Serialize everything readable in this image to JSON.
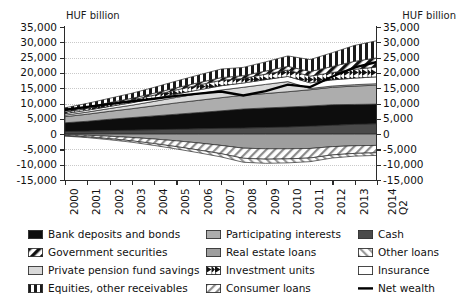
{
  "units": {
    "left": "HUF billion",
    "right": "HUF billion"
  },
  "axes": {
    "y_ticks": [
      "35,000",
      "30,000",
      "25,000",
      "20,000",
      "15,000",
      "10,000",
      "5,000",
      "0",
      "-5,000",
      "-10,000",
      "-15,000"
    ],
    "y_values": [
      35000,
      30000,
      25000,
      20000,
      15000,
      10000,
      5000,
      0,
      -5000,
      -10000,
      -15000
    ],
    "x_ticks": [
      "2000",
      "2001",
      "2002",
      "2003",
      "2004",
      "2005",
      "2006",
      "2007",
      "2008",
      "2009",
      "2010",
      "2011",
      "2012",
      "2013",
      "2014"
    ],
    "x_last_sub": "Q2"
  },
  "legend": {
    "col1": [
      {
        "label": "Bank deposits and bonds",
        "swatch": "solid-dark"
      },
      {
        "label": "Government securities",
        "swatch": "diag-black-white"
      },
      {
        "label": "Private pension fund savings",
        "swatch": "solid-light"
      },
      {
        "label": "Equities, other receivables",
        "swatch": "vertical-black"
      }
    ],
    "col2": [
      {
        "label": "Participating interests",
        "swatch": "solid-mid"
      },
      {
        "label": "Real estate loans",
        "swatch": "solid-midlight"
      },
      {
        "label": "Investment units",
        "swatch": "wedge-black"
      },
      {
        "label": "Consumer loans",
        "swatch": "diag-hatch-dark"
      }
    ],
    "col3": [
      {
        "label": "Cash",
        "swatch": "solid-dark2"
      },
      {
        "label": "Other loans",
        "swatch": "diag-hatch-mid"
      },
      {
        "label": "Insurance",
        "swatch": "solid-white"
      },
      {
        "label": "Net wealth",
        "swatch": "line-black"
      }
    ]
  },
  "chart_data": {
    "type": "area",
    "title": "",
    "subtitle": "",
    "xlabel": "",
    "ylabel": "HUF billion",
    "ylim": [
      -15000,
      35000
    ],
    "grid": true,
    "legend_position": "bottom",
    "stacked": true,
    "x": [
      "2000",
      "2001",
      "2002",
      "2003",
      "2004",
      "2005",
      "2006",
      "2007",
      "2008",
      "2009",
      "2010",
      "2011",
      "2012",
      "2013",
      "2014 Q2"
    ],
    "series": [
      {
        "name": "Cash",
        "sign": "positive",
        "fill": "solid-dark2",
        "values": [
          900,
          1000,
          1150,
          1300,
          1450,
          1600,
          1750,
          1900,
          2000,
          2150,
          2350,
          2600,
          2900,
          3200,
          3400
        ]
      },
      {
        "name": "Bank deposits and bonds",
        "sign": "positive",
        "fill": "solid-dark",
        "values": [
          2800,
          3200,
          3700,
          4100,
          4500,
          4900,
          5300,
          5700,
          6200,
          6400,
          6500,
          6600,
          6700,
          6500,
          6400
        ]
      },
      {
        "name": "Participating interests",
        "sign": "positive",
        "fill": "solid-mid",
        "values": [
          2000,
          2300,
          2600,
          2900,
          3300,
          3700,
          4000,
          4300,
          4500,
          4700,
          5000,
          5300,
          5700,
          6000,
          6200
        ]
      },
      {
        "name": "Private pension fund savings",
        "sign": "positive",
        "fill": "solid-light",
        "values": [
          500,
          700,
          900,
          1150,
          1450,
          1800,
          2150,
          2500,
          2600,
          3000,
          3300,
          400,
          420,
          450,
          470
        ]
      },
      {
        "name": "Insurance",
        "sign": "positive",
        "fill": "solid-white",
        "values": [
          500,
          600,
          700,
          800,
          950,
          1100,
          1250,
          1400,
          1400,
          1550,
          1700,
          1850,
          2000,
          2150,
          2250
        ]
      },
      {
        "name": "Investment units",
        "sign": "positive",
        "fill": "wedge-black",
        "values": [
          500,
          600,
          750,
          900,
          1100,
          1350,
          1600,
          1800,
          1500,
          1800,
          2100,
          2200,
          2400,
          2900,
          3200
        ]
      },
      {
        "name": "Government securities",
        "sign": "positive",
        "fill": "diag-black-white",
        "values": [
          400,
          450,
          500,
          550,
          620,
          700,
          780,
          850,
          900,
          1000,
          1200,
          1500,
          2000,
          2600,
          3000
        ]
      },
      {
        "name": "Equities, other receivables",
        "sign": "positive",
        "fill": "vertical-black",
        "values": [
          1000,
          1200,
          1400,
          1650,
          1900,
          2200,
          2500,
          2800,
          2700,
          3000,
          3400,
          3900,
          4500,
          5200,
          5600
        ]
      },
      {
        "name": "Real estate loans",
        "sign": "negative",
        "fill": "solid-midlight",
        "values": [
          -200,
          -400,
          -700,
          -1100,
          -1600,
          -2200,
          -2900,
          -3700,
          -4600,
          -4800,
          -4800,
          -4700,
          -4100,
          -3800,
          -3700
        ]
      },
      {
        "name": "Consumer loans",
        "sign": "negative",
        "fill": "diag-hatch-dark",
        "values": [
          -300,
          -500,
          -800,
          -1100,
          -1500,
          -1900,
          -2300,
          -2700,
          -3300,
          -3400,
          -3300,
          -3100,
          -2700,
          -2500,
          -2400
        ]
      },
      {
        "name": "Other loans",
        "sign": "negative",
        "fill": "diag-hatch-mid",
        "values": [
          -150,
          -250,
          -350,
          -450,
          -600,
          -750,
          -900,
          -1050,
          -1300,
          -1350,
          -1300,
          -1200,
          -1000,
          -900,
          -850
        ]
      }
    ],
    "net_wealth": {
      "name": "Net wealth",
      "values": [
        7950,
        8900,
        9850,
        10700,
        11570,
        12500,
        13230,
        13900,
        12600,
        14050,
        16150,
        15350,
        18820,
        21800,
        23570
      ]
    }
  }
}
